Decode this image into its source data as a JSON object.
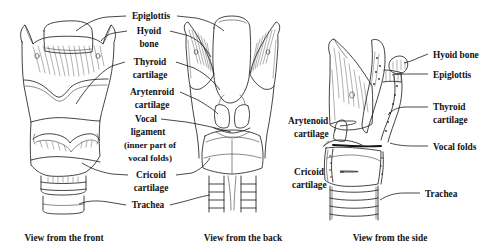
{
  "figure": {
    "background_color": "#ffffff",
    "ink_color": "#222222",
    "label_color": "#111111"
  },
  "captions": [
    {
      "id": "front",
      "text": "View from the front"
    },
    {
      "id": "back",
      "text": "View from the back"
    },
    {
      "id": "side",
      "text": "View from the side"
    }
  ],
  "center_labels": {
    "epiglottis": "Epiglottis",
    "hyoid_line1": "Hyoid",
    "hyoid_line2": "bone",
    "thyroid_line1": "Thyroid",
    "thyroid_line2": "cartilage",
    "arytenoid_line1": "Arytenroid",
    "arytenoid_line2": "cartilage",
    "vocal_line1": "Vocal",
    "vocal_line2": "ligament",
    "vocal_line3": "(inner part of",
    "vocal_line4": "vocal folds)",
    "cricoid_line1": "Cricoid",
    "cricoid_line2": "cartilage",
    "trachea": "Trachea"
  },
  "side_labels": {
    "arytenoid_line1": "Arytenoid",
    "arytenoid_line2": "cartilage",
    "cricoid_line1": "Cricoid",
    "cricoid_line2": "cartilage",
    "hyoid_bone": "Hyoid bone",
    "epiglottis": "Epiglottis",
    "thyroid_line1": "Thyroid",
    "thyroid_line2": "cartilage",
    "vocal_folds": "Vocal folds",
    "trachea": "Trachea"
  }
}
